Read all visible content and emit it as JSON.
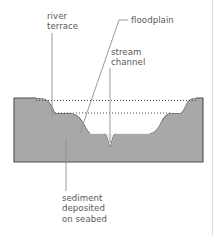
{
  "figure": {
    "type": "cross-section-diagram",
    "canvas": {
      "width": 213,
      "height": 236,
      "background": "#ffffff"
    },
    "colors": {
      "bedrock_fill": "#a8a8a8",
      "bedrock_stroke": "#4d4d4d",
      "valley_fill": "#fafafa",
      "sediment_fill": "#f2f2f2",
      "leader_line": "#8c8c8c",
      "dotted_line": "#555555",
      "label_text": "#58585a"
    }
  },
  "labels": {
    "river_terrace": "river\nterrace",
    "floodplain": "floodplain",
    "stream_channel": "stream\nchannel",
    "sediment": "sediment\ndeposited\non seabed"
  },
  "annotations": [
    {
      "name": "river-terrace",
      "text": "river terrace",
      "leader": "vertical",
      "target": "terrace bench on left valley wall"
    },
    {
      "name": "floodplain",
      "text": "floodplain",
      "leader": "elbow-diagonal",
      "target": "flat valley floor"
    },
    {
      "name": "stream-channel",
      "text": "stream channel",
      "leader": "vertical",
      "target": "central V-notch incision"
    },
    {
      "name": "sediment",
      "text": "sediment deposited on seabed",
      "leader": "vertical",
      "target": "valley-fill sediment body"
    }
  ],
  "features": {
    "dotted_levels": [
      {
        "name": "upper-terrace-level",
        "y": 101
      },
      {
        "name": "lower-terrace-level",
        "y": 113
      }
    ]
  }
}
